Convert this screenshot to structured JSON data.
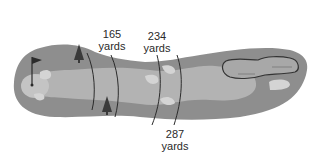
{
  "diagram": {
    "colors": {
      "rough": "#8e8e8e",
      "fairway": "#b3b3b3",
      "bunker": "#d4d4d4",
      "water_outline": "#333333",
      "marker_line": "#2b2b2b",
      "tree": "#3a3a3a",
      "text": "#2a2a2a"
    },
    "distance_markers": [
      {
        "value": "165",
        "unit": "yards"
      },
      {
        "value": "234",
        "unit": "yards"
      },
      {
        "value": "287",
        "unit": "yards"
      }
    ],
    "icons": [
      "flag-icon",
      "tree-icon",
      "tree-icon"
    ]
  }
}
